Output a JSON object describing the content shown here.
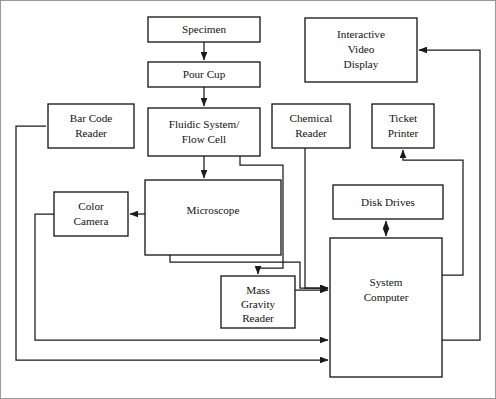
{
  "diagram": {
    "type": "block-flow-diagram",
    "canvas": {
      "width": 496,
      "height": 399,
      "background": "#ffffff"
    },
    "colors": {
      "box_stroke": "#1a1a1a",
      "box_fill": "#ffffff",
      "line": "#1a1a1a",
      "text": "#111111",
      "frame": "#9a9a9a"
    },
    "nodes": [
      {
        "id": "specimen",
        "label": "Specimen",
        "lines": [
          "Specimen"
        ],
        "x": 148,
        "y": 17,
        "w": 112,
        "h": 25
      },
      {
        "id": "pour-cup",
        "label": "Pour Cup",
        "lines": [
          "Pour Cup"
        ],
        "x": 148,
        "y": 62,
        "w": 112,
        "h": 25
      },
      {
        "id": "fluidic-system-flow-cell",
        "label": "Fluidic System/ Flow Cell",
        "lines": [
          "Fluidic System/",
          "Flow Cell"
        ],
        "x": 148,
        "y": 108,
        "w": 112,
        "h": 48
      },
      {
        "id": "interactive-video-display",
        "label": "Interactive Video Display",
        "lines": [
          "Interactive",
          "Video",
          "Display"
        ],
        "x": 305,
        "y": 18,
        "w": 112,
        "h": 64
      },
      {
        "id": "bar-code-reader",
        "label": "Bar Code Reader",
        "lines": [
          "Bar Code",
          "Reader"
        ],
        "x": 48,
        "y": 104,
        "w": 86,
        "h": 44
      },
      {
        "id": "chemical-reader",
        "label": "Chemical Reader",
        "lines": [
          "Chemical",
          "Reader"
        ],
        "x": 272,
        "y": 104,
        "w": 78,
        "h": 44
      },
      {
        "id": "ticket-printer",
        "label": "Ticket Printer",
        "lines": [
          "Ticket",
          "Printer"
        ],
        "x": 372,
        "y": 104,
        "w": 62,
        "h": 44
      },
      {
        "id": "microscope",
        "label": "Microscope",
        "lines": [
          "Microscope"
        ],
        "x": 145,
        "y": 180,
        "w": 136,
        "h": 75
      },
      {
        "id": "color-camera",
        "label": "Color Camera",
        "lines": [
          "Color",
          "Camera"
        ],
        "x": 54,
        "y": 192,
        "w": 74,
        "h": 44
      },
      {
        "id": "disk-drives",
        "label": "Disk Drives",
        "lines": [
          "Disk Drives"
        ],
        "x": 333,
        "y": 185,
        "w": 110,
        "h": 34
      },
      {
        "id": "mass-gravity-reader",
        "label": "Mass Gravity Reader",
        "lines": [
          "Mass",
          "Gravity",
          "Reader"
        ],
        "x": 221,
        "y": 276,
        "w": 74,
        "h": 52
      },
      {
        "id": "system-computer",
        "label": "System Computer",
        "lines": [
          "System",
          "Computer"
        ],
        "x": 330,
        "y": 238,
        "w": 112,
        "h": 139
      }
    ],
    "edges": [
      {
        "id": "specimen-to-pour-cup",
        "from": "specimen",
        "to": "pour-cup",
        "arrow": "single"
      },
      {
        "id": "pour-cup-to-fluidic",
        "from": "pour-cup",
        "to": "fluidic-system-flow-cell",
        "arrow": "single"
      },
      {
        "id": "fluidic-to-microscope",
        "from": "fluidic-system-flow-cell",
        "to": "microscope",
        "arrow": "single"
      },
      {
        "id": "fluidic-to-mass-gravity-reader",
        "from": "fluidic-system-flow-cell",
        "to": "mass-gravity-reader",
        "arrow": "single"
      },
      {
        "id": "microscope-to-color-camera",
        "from": "microscope",
        "to": "color-camera",
        "arrow": "single"
      },
      {
        "id": "microscope-to-system-computer",
        "from": "microscope",
        "to": "system-computer",
        "arrow": "single"
      },
      {
        "id": "mass-gravity-reader-to-system-computer",
        "from": "mass-gravity-reader",
        "to": "system-computer",
        "arrow": "single"
      },
      {
        "id": "chemical-reader-to-system-computer",
        "from": "chemical-reader",
        "to": "system-computer",
        "arrow": "single"
      },
      {
        "id": "disk-drives-system-computer",
        "from": "disk-drives",
        "to": "system-computer",
        "arrow": "double"
      },
      {
        "id": "system-computer-to-ticket-printer",
        "from": "system-computer",
        "to": "ticket-printer",
        "arrow": "single"
      },
      {
        "id": "system-computer-to-interactive-video-display",
        "from": "system-computer",
        "to": "interactive-video-display",
        "arrow": "single"
      },
      {
        "id": "bar-code-reader-to-system-computer",
        "from": "bar-code-reader",
        "to": "system-computer",
        "arrow": "single"
      },
      {
        "id": "color-camera-to-system-computer",
        "from": "color-camera",
        "to": "system-computer",
        "arrow": "single"
      }
    ]
  }
}
